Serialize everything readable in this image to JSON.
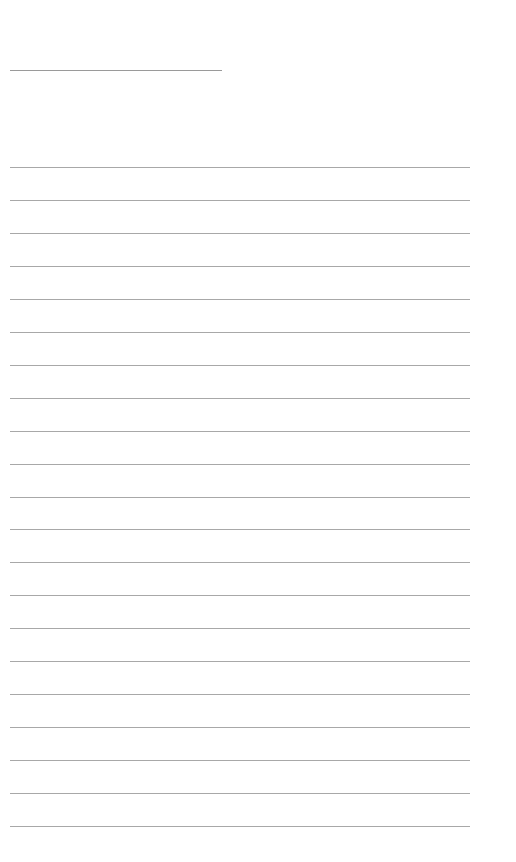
{
  "page": {
    "type": "blank lined writing sheet",
    "title_line": {
      "left": 10,
      "top": 70,
      "width": 212
    },
    "rules": {
      "count": 21,
      "first_top": 167,
      "spacing": 32.95,
      "left": 10,
      "width": 460
    },
    "colors": {
      "background": "#ffffff",
      "line": "#a8a8a8"
    }
  }
}
